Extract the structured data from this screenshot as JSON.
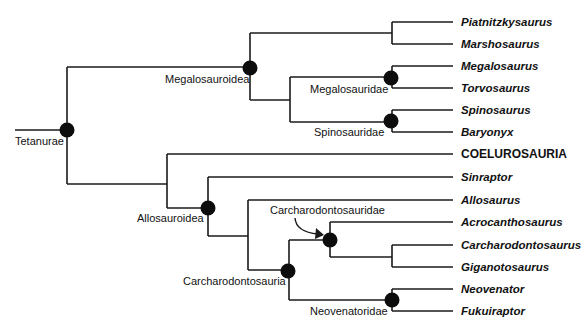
{
  "diagram": {
    "type": "cladogram",
    "tips": [
      {
        "id": "piatnitzkysaurus",
        "label": "Piatnitzkysaurus",
        "italic": true,
        "y": 22
      },
      {
        "id": "marshosaurus",
        "label": "Marshosaurus",
        "italic": true,
        "y": 44
      },
      {
        "id": "megalosaurus",
        "label": "Megalosaurus",
        "italic": true,
        "y": 66
      },
      {
        "id": "torvosaurus",
        "label": "Torvosaurus",
        "italic": true,
        "y": 88
      },
      {
        "id": "spinosaurus",
        "label": "Spinosaurus",
        "italic": true,
        "y": 110
      },
      {
        "id": "baryonyx",
        "label": "Baryonyx",
        "italic": true,
        "y": 132
      },
      {
        "id": "coelurosauria",
        "label": "COELUROSAURIA",
        "italic": false,
        "y": 154
      },
      {
        "id": "sinraptor",
        "label": "Sinraptor",
        "italic": true,
        "y": 177
      },
      {
        "id": "allosaurus",
        "label": "Allosaurus",
        "italic": true,
        "y": 200
      },
      {
        "id": "acrocanthosaurus",
        "label": "Acrocanthosaurus",
        "italic": true,
        "y": 222
      },
      {
        "id": "carcharodontosaurus",
        "label": "Carcharodontosaurus",
        "italic": true,
        "y": 245
      },
      {
        "id": "giganotosaurus",
        "label": "Giganotosaurus",
        "italic": true,
        "y": 267
      },
      {
        "id": "neovenator",
        "label": "Neovenator",
        "italic": true,
        "y": 289
      },
      {
        "id": "fukuiraptor",
        "label": "Fukuiraptor",
        "italic": true,
        "y": 311
      }
    ],
    "clades": {
      "tetanurae": "Tetanurae",
      "megalosauroidea": "Megalosauroidea",
      "megalosauridae": "Megalosauridae",
      "spinosauridae": "Spinosauridae",
      "allosauroidea": "Allosauroidea",
      "carcharodontosauria": "Carcharodontosauria",
      "carcharodontosauridae": "Carcharodontosauridae",
      "neovenatoridae": "Neovenatoridae"
    },
    "line_color": "#1a1a1a",
    "node_color": "#0d0d0d"
  }
}
